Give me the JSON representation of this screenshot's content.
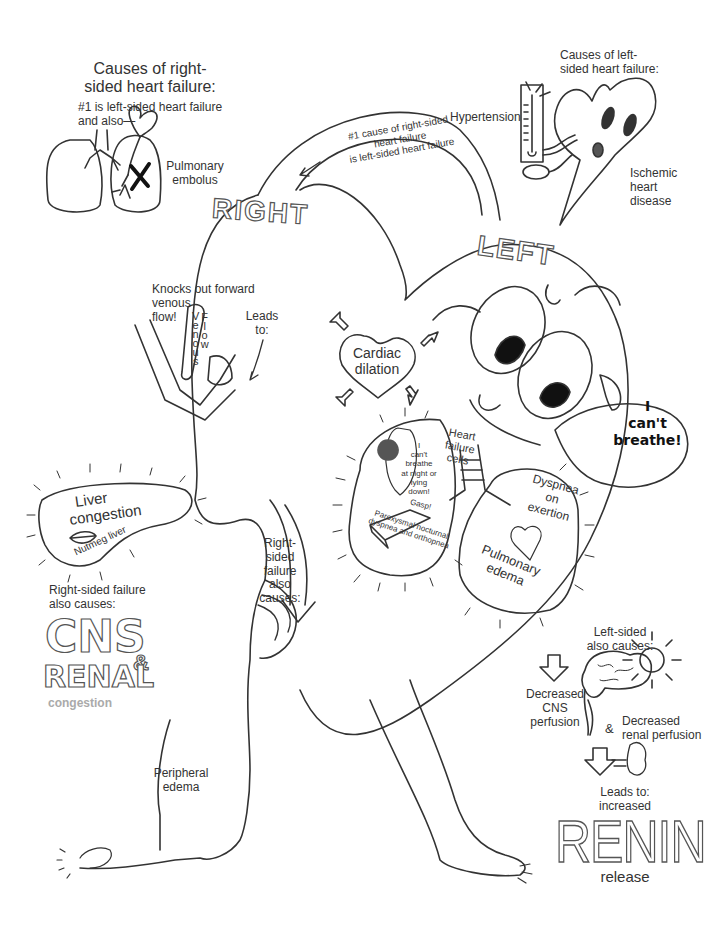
{
  "right_causes": {
    "title_line1": "Causes of right-",
    "title_line2": "sided heart failure:",
    "sub_line1": "#1 is left-sided heart failure",
    "sub_line2": "and also—",
    "pe_line1": "Pulmonary",
    "pe_line2": "embolus"
  },
  "left_causes": {
    "title_line1": "Causes of left-",
    "title_line2": "sided heart failure:",
    "hypertension": "Hypertension",
    "ischemic_line1": "Ischemic",
    "ischemic_line2": "heart",
    "ischemic_line3": "disease"
  },
  "arc_arrow": {
    "line1": "#1 cause of right-sided",
    "line2": "heart failure",
    "line3": "is left-sided heart failure"
  },
  "heart_labels": {
    "right": "RIGHT",
    "left": "LEFT"
  },
  "venous": {
    "knock_line1": "Knocks out forward",
    "knock_line2": "venous",
    "knock_line3": "flow!",
    "venous_word": "Venous",
    "flow_word": "Flow",
    "leads_line1": "Leads",
    "leads_line2": "to:"
  },
  "cardiac_dilation": {
    "line1": "Cardiac",
    "line2": "dilation"
  },
  "lungs": {
    "heart_failure_cells_line1": "Heart",
    "heart_failure_cells_line2": "failure",
    "heart_failure_cells_line3": "cells",
    "pnd_bubble": [
      "I",
      "can't",
      "breathe",
      "at night or",
      "lying",
      "down!"
    ],
    "gasp": "Gasp!",
    "pnd_caption_line1": "Paroxysmal nocturnal",
    "pnd_caption_line2": "dyspnea and orthopnea",
    "doe_line1": "Dyspnea",
    "doe_line2": "on",
    "doe_line3": "exertion",
    "edema_line1": "Pulmonary",
    "edema_line2": "edema"
  },
  "speech": {
    "line1": "I",
    "line2": "can't",
    "line3": "breathe!"
  },
  "liver": {
    "line1": "Liver",
    "line2": "congestion",
    "nutmeg": "Nutmeg liver"
  },
  "right_also": {
    "caption_line1": "Right-sided failure",
    "caption_line2": "also causes:",
    "cns": "CNS",
    "amp": "&",
    "renal": "RENAL",
    "congestion": "congestion",
    "arrow_line1": "Right-",
    "arrow_line2": "sided",
    "arrow_line3": "failure",
    "arrow_line4": "also",
    "arrow_line5": "causes:"
  },
  "peripheral": {
    "line1": "Peripheral",
    "line2": "edema"
  },
  "left_also": {
    "caption_line1": "Left-sided",
    "caption_line2": "also causes:",
    "cns_line1": "Decreased",
    "cns_line2": "CNS",
    "cns_line3": "perfusion",
    "amp": "&",
    "renal_line1": "Decreased",
    "renal_line2": "renal perfusion",
    "leads_line1": "Leads to:",
    "leads_line2": "increased",
    "renin": "RENIN",
    "release": "release"
  }
}
